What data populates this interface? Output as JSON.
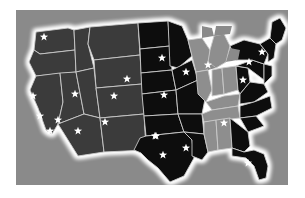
{
  "figure": {
    "background_color": "#ffffff",
    "panel_color": "#8a8a8a",
    "glow_color": "#ffffff",
    "border_color": "#c9c9c9"
  },
  "legend": {
    "tiers": [
      {
        "key": "tier-dark",
        "label": "Darkest shaded states",
        "color": "#0b0b0b"
      },
      {
        "key": "tier-mid",
        "label": "Medium shaded states",
        "color": "#3a3a3a"
      },
      {
        "key": "tier-light",
        "label": "Lightest shaded states",
        "color": "#8e8e8e"
      }
    ]
  },
  "chart_data": {
    "type": "map",
    "projection": "stylized-albers",
    "grid": false,
    "legend_position": "none",
    "value_field": "shade_tier",
    "categories": [
      "tier-light",
      "tier-mid",
      "tier-dark"
    ],
    "regions": [
      {
        "name": "Washington",
        "tier": "tier-mid"
      },
      {
        "name": "Oregon",
        "tier": "tier-mid"
      },
      {
        "name": "California",
        "tier": "tier-mid"
      },
      {
        "name": "Nevada",
        "tier": "tier-mid"
      },
      {
        "name": "Idaho",
        "tier": "tier-mid"
      },
      {
        "name": "Montana",
        "tier": "tier-mid"
      },
      {
        "name": "Wyoming",
        "tier": "tier-mid"
      },
      {
        "name": "Utah",
        "tier": "tier-mid"
      },
      {
        "name": "Arizona",
        "tier": "tier-mid"
      },
      {
        "name": "Colorado",
        "tier": "tier-mid"
      },
      {
        "name": "New Mexico",
        "tier": "tier-mid"
      },
      {
        "name": "North Dakota",
        "tier": "tier-dark"
      },
      {
        "name": "South Dakota",
        "tier": "tier-dark"
      },
      {
        "name": "Nebraska",
        "tier": "tier-dark"
      },
      {
        "name": "Kansas",
        "tier": "tier-dark"
      },
      {
        "name": "Oklahoma",
        "tier": "tier-dark"
      },
      {
        "name": "Texas",
        "tier": "tier-dark"
      },
      {
        "name": "Minnesota",
        "tier": "tier-dark"
      },
      {
        "name": "Iowa",
        "tier": "tier-dark"
      },
      {
        "name": "Missouri",
        "tier": "tier-dark"
      },
      {
        "name": "Arkansas",
        "tier": "tier-dark"
      },
      {
        "name": "Louisiana",
        "tier": "tier-dark"
      },
      {
        "name": "Wisconsin",
        "tier": "tier-light"
      },
      {
        "name": "Illinois",
        "tier": "tier-light"
      },
      {
        "name": "Michigan",
        "tier": "tier-light"
      },
      {
        "name": "Indiana",
        "tier": "tier-light"
      },
      {
        "name": "Ohio",
        "tier": "tier-light"
      },
      {
        "name": "Kentucky",
        "tier": "tier-light"
      },
      {
        "name": "Tennessee",
        "tier": "tier-light"
      },
      {
        "name": "Mississippi",
        "tier": "tier-light"
      },
      {
        "name": "Alabama",
        "tier": "tier-light"
      },
      {
        "name": "West Virginia",
        "tier": "tier-dark"
      },
      {
        "name": "Virginia",
        "tier": "tier-dark"
      },
      {
        "name": "North Carolina",
        "tier": "tier-dark"
      },
      {
        "name": "South Carolina",
        "tier": "tier-dark"
      },
      {
        "name": "Georgia",
        "tier": "tier-dark"
      },
      {
        "name": "Florida",
        "tier": "tier-dark"
      },
      {
        "name": "Pennsylvania",
        "tier": "tier-dark"
      },
      {
        "name": "New York",
        "tier": "tier-dark"
      },
      {
        "name": "Maine",
        "tier": "tier-dark"
      },
      {
        "name": "New England",
        "tier": "tier-dark"
      },
      {
        "name": "Mid-Atlantic",
        "tier": "tier-dark"
      }
    ],
    "markers": {
      "symbol": "star",
      "color": "#ffffff",
      "count": 22,
      "points": [
        {
          "label": "Pacific Northwest",
          "x": 44,
          "y": 37
        },
        {
          "label": "Northern California",
          "x": 33,
          "y": 96
        },
        {
          "label": "Central California",
          "x": 40,
          "y": 116
        },
        {
          "label": "Southern California",
          "x": 50,
          "y": 131
        },
        {
          "label": "Nevada",
          "x": 58,
          "y": 120
        },
        {
          "label": "Arizona",
          "x": 78,
          "y": 131
        },
        {
          "label": "Utah",
          "x": 75,
          "y": 94
        },
        {
          "label": "Colorado",
          "x": 114,
          "y": 96
        },
        {
          "label": "New Mexico",
          "x": 105,
          "y": 122
        },
        {
          "label": "Upper Midwest",
          "x": 162,
          "y": 58
        },
        {
          "label": "Great Plains",
          "x": 127,
          "y": 79
        },
        {
          "label": "Kansas City",
          "x": 164,
          "y": 95
        },
        {
          "label": "Chicago",
          "x": 186,
          "y": 72
        },
        {
          "label": "Great Lakes East",
          "x": 208,
          "y": 65
        },
        {
          "label": "Oklahoma",
          "x": 155,
          "y": 136
        },
        {
          "label": "North Texas",
          "x": 156,
          "y": 136
        },
        {
          "label": "South Texas",
          "x": 163,
          "y": 155
        },
        {
          "label": "Gulf Coast",
          "x": 186,
          "y": 148
        },
        {
          "label": "Georgia",
          "x": 224,
          "y": 123
        },
        {
          "label": "Florida",
          "x": 248,
          "y": 163
        },
        {
          "label": "Mid-Atlantic",
          "x": 243,
          "y": 80
        },
        {
          "label": "Northeast",
          "x": 249,
          "y": 62
        },
        {
          "label": "New England",
          "x": 262,
          "y": 52
        }
      ]
    }
  }
}
